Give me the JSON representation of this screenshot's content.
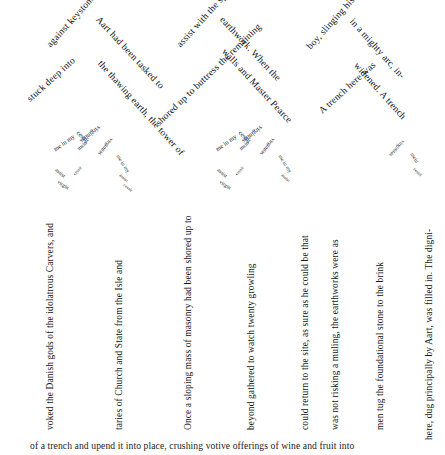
{
  "artwork": {
    "title": "Typographic text-path composition",
    "ink_color": "#141414",
    "background_color": "#ffffff",
    "description": "Prose set along zigzag chevron paths above vertical running columns, with nested miniature repeating-text motifs"
  },
  "arch_paths": {
    "peak1_left": "against keystones",
    "peak1_left_lower": "stuck deep into",
    "peak1_right": "Aart had been tasked to",
    "peak1_right_lower": "the thawing earth, the tower of",
    "peak2_left": "assist with the spring",
    "peak2_left_lower": "shored up to buttress the remaining",
    "peak2_right": "earthwork. When the",
    "peak2_right_lower": "walls and Master Pearce",
    "peak3_left": "boy, slinging his pick",
    "peak3_left_lower": "A trench here was",
    "peak3_right": "in a mighty arc, in-",
    "peak3_right_lower": "widened. A trench",
    "peak_tail": "here, dug principally by Aart, was filled in. The digni-"
  },
  "columns": [
    {
      "id": "col-1",
      "text": "voked the Danish gods of the idolatrous Carvers, and"
    },
    {
      "id": "col-2",
      "text": "taries of Church and State from the Isle and"
    },
    {
      "id": "col-3",
      "text": "Once a sloping mass of masonry had been shored up to"
    },
    {
      "id": "col-4",
      "text": "beyond gathered to watch twenty growling"
    },
    {
      "id": "col-5",
      "text": "could return to the site, as sure as he could be that"
    },
    {
      "id": "col-6",
      "text": "was not risking a muling, the earthworks were as"
    },
    {
      "id": "col-7",
      "text": "men tug the foundational stone to the brink"
    },
    {
      "id": "col-8",
      "text": "here, dug principally by Aart, was filled in. The digni-"
    }
  ],
  "bottom_line": {
    "text": "of a trench and upend it into place, crushing votive offerings of wine and fruit into"
  },
  "micro_motif": {
    "phrase_a": "virginitas",
    "phrase_b": "me in my",
    "phrase_c": "cessit",
    "phrase_d": "virgin",
    "phrase_e": "assist",
    "phrase_f": "mein"
  }
}
